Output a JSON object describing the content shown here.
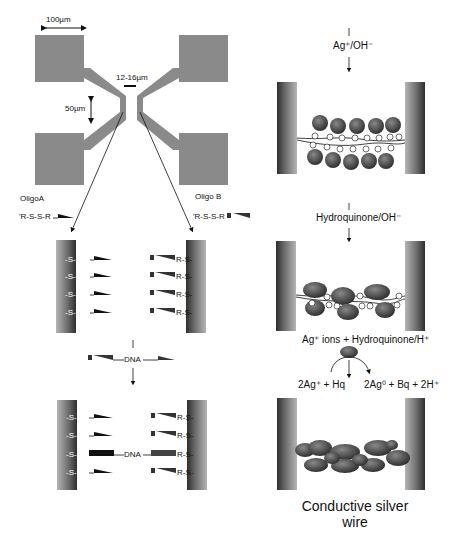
{
  "panel_a": {
    "dimension_100": "100µm",
    "dimension_gap": "12-16µm",
    "dimension_50": "50µm",
    "oligo_a_label": "OligoA",
    "oligo_b_label": "Oligo B",
    "oligo_a_formula": "'R-S-S-R",
    "oligo_b_formula": "'R-S-S-R"
  },
  "panel_b": {
    "left_groups": [
      "-S-R-",
      "-S-R-",
      "-S-R-",
      "-S-R-"
    ],
    "right_groups": [
      "R-S-",
      "R-S-",
      "R-S-",
      "R-S-"
    ],
    "dna_label": "DNA"
  },
  "panel_c": {
    "left_groups": [
      "-S-R-",
      "-S-R-",
      "-S-R-",
      "-S-R-"
    ],
    "right_groups": [
      "R-S-",
      "R-S-",
      "R-S-",
      "R-S-"
    ],
    "dna_label": "DNA"
  },
  "panel_d": {
    "reagent": "Ag⁺/OH⁻",
    "ion_label": "Ag⁺"
  },
  "panel_e": {
    "reagent": "Hydroquinone/OH⁻",
    "product_label": "Ag"
  },
  "panel_f": {
    "reagent": "Ag⁺ ions + Hydroquinone/H⁺",
    "reaction_left": "2Ag⁺ + Hq",
    "reaction_right": "2Ag⁰ + Bq + 2H⁺",
    "caption_line1": "Conductive silver",
    "caption_line2": "wire"
  },
  "colors": {
    "electrode_fill": "#8a8a8a",
    "electrode_dark": "#3a3a3a",
    "sphere_fill": "#555555",
    "ink": "#111111"
  }
}
